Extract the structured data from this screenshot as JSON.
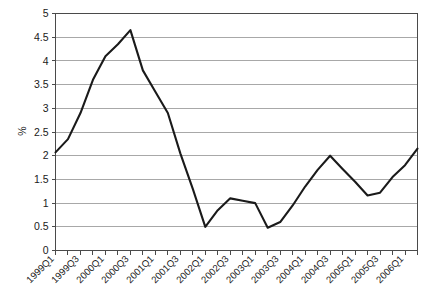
{
  "chart_data": {
    "type": "line",
    "title": "",
    "subtitle": "",
    "xlabel": "",
    "ylabel": "%",
    "ylim": [
      0,
      5
    ],
    "ytick_step": 0.5,
    "yticks": [
      "0",
      "0.5",
      "1",
      "1.5",
      "2",
      "2.5",
      "3",
      "3.5",
      "4",
      "4.5",
      "5"
    ],
    "grid": "horizontal",
    "legend": "none",
    "line_color": "#1a1a1a",
    "grid_color": "#a8a8a8",
    "axis_color": "#4a4a4a",
    "background": "#ffffff",
    "x": [
      "1999Q1",
      "1999Q2",
      "1999Q3",
      "1999Q4",
      "2000Q1",
      "2000Q2",
      "2000Q3",
      "2000Q4",
      "2001Q1",
      "2001Q2",
      "2001Q3",
      "2001Q4",
      "2002Q1",
      "2002Q2",
      "2002Q3",
      "2002Q4",
      "2003Q1",
      "2003Q2",
      "2003Q3",
      "2003Q4",
      "2004Q1",
      "2004Q2",
      "2004Q3",
      "2004Q4",
      "2005Q1",
      "2005Q2",
      "2005Q3",
      "2005Q4",
      "2006Q1",
      "2006Q2"
    ],
    "xtick_labels_shown": [
      "1999Q1",
      "1999Q3",
      "2000Q1",
      "2000Q3",
      "2001Q1",
      "2001Q3",
      "2002Q1",
      "2002Q3",
      "2003Q1",
      "2003Q3",
      "2004Q1",
      "2004Q3",
      "2005Q1",
      "2005Q3",
      "2006Q1"
    ],
    "values": [
      2.07,
      2.35,
      2.9,
      3.6,
      4.1,
      4.35,
      4.65,
      3.8,
      3.35,
      2.9,
      2.05,
      1.3,
      0.5,
      0.85,
      1.1,
      1.05,
      1.0,
      0.48,
      0.6,
      0.95,
      1.35,
      1.7,
      2.0,
      1.72,
      1.45,
      1.16,
      1.22,
      1.55,
      1.8,
      2.15
    ]
  }
}
